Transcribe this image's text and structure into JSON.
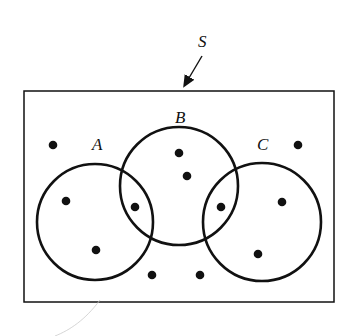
{
  "diagram": {
    "type": "venn",
    "universe_label": "S",
    "sets": [
      {
        "label": "A",
        "cx": 95,
        "cy": 222,
        "r": 58,
        "label_x": 92,
        "label_y": 150
      },
      {
        "label": "B",
        "cx": 179,
        "cy": 186,
        "r": 59,
        "label_x": 175,
        "label_y": 123
      },
      {
        "label": "C",
        "cx": 262,
        "cy": 222,
        "r": 59,
        "label_x": 257,
        "label_y": 150
      }
    ],
    "points": [
      {
        "region": "S only",
        "x": 53,
        "y": 145
      },
      {
        "region": "S only",
        "x": 298,
        "y": 145
      },
      {
        "region": "A only",
        "x": 66,
        "y": 201
      },
      {
        "region": "A only",
        "x": 96,
        "y": 250
      },
      {
        "region": "A∩B",
        "x": 135,
        "y": 207
      },
      {
        "region": "B only",
        "x": 179,
        "y": 153
      },
      {
        "region": "B only",
        "x": 187,
        "y": 176
      },
      {
        "region": "B∩C",
        "x": 221,
        "y": 207
      },
      {
        "region": "C only",
        "x": 282,
        "y": 202
      },
      {
        "region": "C only",
        "x": 258,
        "y": 254
      },
      {
        "region": "S only",
        "x": 152,
        "y": 275
      },
      {
        "region": "S only",
        "x": 200,
        "y": 275
      }
    ],
    "stroke_color": "#111111"
  }
}
